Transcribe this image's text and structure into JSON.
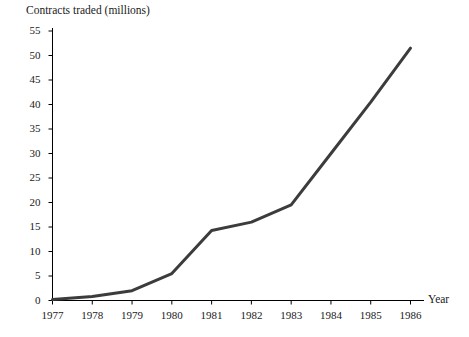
{
  "chart_data": {
    "type": "line",
    "title": "Contracts traded (millions)",
    "xlabel": "Year",
    "ylabel": "Contracts traded (millions)",
    "categories": [
      "1977",
      "1978",
      "1979",
      "1980",
      "1981",
      "1982",
      "1983",
      "1984",
      "1985",
      "1986"
    ],
    "x": [
      1977,
      1978,
      1979,
      1980,
      1981,
      1982,
      1983,
      1984,
      1985,
      1986
    ],
    "values": [
      0.2,
      0.8,
      2.0,
      5.5,
      14.3,
      16.0,
      19.5,
      30.0,
      40.5,
      51.5
    ],
    "xlim": [
      1977,
      1986
    ],
    "ylim": [
      0,
      55
    ],
    "ytick_values": [
      0,
      5,
      10,
      15,
      20,
      25,
      30,
      35,
      40,
      45,
      50,
      55
    ],
    "ytick_labels": [
      "0",
      "5",
      "10",
      "15",
      "20",
      "25",
      "30",
      "35",
      "40",
      "45",
      "50",
      "55"
    ],
    "xtick_labels": [
      "1977",
      "1978",
      "1979",
      "1980",
      "1981",
      "1982",
      "1983",
      "1984",
      "1985",
      "1986"
    ],
    "grid": false,
    "legend": false,
    "series_color": "#3c3c3c",
    "axis_color": "#000000",
    "background_color": "#ffffff"
  }
}
